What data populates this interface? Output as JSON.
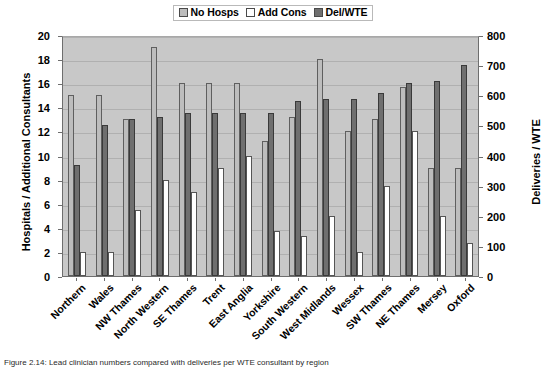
{
  "legend": {
    "position": "top-center",
    "items": [
      {
        "label": "No Hosps",
        "color": "#bdbdbd",
        "key": "no_hosps"
      },
      {
        "label": "Add Cons",
        "color": "#ffffff",
        "key": "add_cons"
      },
      {
        "label": "Del/WTE",
        "color": "#6f6f6f",
        "key": "del_wte"
      }
    ]
  },
  "caption": {
    "text": "Figure 2.14: Lead clinician numbers compared with deliveries per WTE consultant by region"
  },
  "chart_data": {
    "type": "bar",
    "title": "",
    "subtitle": "",
    "xlabel": "",
    "ylabel": "Hospitals / Additional Consultants",
    "y2label": "Deliveries / WTE",
    "ylim": [
      0,
      20
    ],
    "y2lim": [
      0,
      800
    ],
    "yticks": [
      0,
      2,
      4,
      6,
      8,
      10,
      12,
      14,
      16,
      18,
      20
    ],
    "y2ticks": [
      0,
      100,
      200,
      300,
      400,
      500,
      600,
      700,
      800
    ],
    "grid": true,
    "plot_background": "#c8c8c8",
    "bar_order": [
      "No Hosps",
      "Del/WTE",
      "Add Cons"
    ],
    "categories": [
      "Northern",
      "Wales",
      "NW Thames",
      "North Western",
      "SE Thames",
      "Trent",
      "East Anglia",
      "Yorkshire",
      "South Western",
      "West Midlands",
      "Wessex",
      "SW Thames",
      "NE Thames",
      "Mersey",
      "Oxford"
    ],
    "series": [
      {
        "name": "No Hosps",
        "axis": "left",
        "color": "#bdbdbd",
        "values": [
          15,
          15,
          13,
          19,
          16,
          16,
          16,
          11.2,
          13.2,
          18,
          12,
          13,
          15.7,
          9,
          9
        ]
      },
      {
        "name": "Del/WTE",
        "axis": "right",
        "color": "#6f6f6f",
        "values_secondary": [
          368,
          500,
          520,
          528,
          540,
          540,
          540,
          540,
          580,
          588,
          588,
          608,
          640,
          648,
          700
        ],
        "values": [
          9.2,
          12.5,
          13,
          13.2,
          13.5,
          13.5,
          13.5,
          13.5,
          14.5,
          14.7,
          14.7,
          15.2,
          16,
          16.2,
          17.5
        ]
      },
      {
        "name": "Add Cons",
        "axis": "left",
        "color": "#ffffff",
        "values": [
          2,
          2,
          5.5,
          8,
          7,
          9,
          10,
          3.7,
          3.3,
          5,
          2,
          7.5,
          12,
          5,
          2.7
        ]
      }
    ]
  }
}
